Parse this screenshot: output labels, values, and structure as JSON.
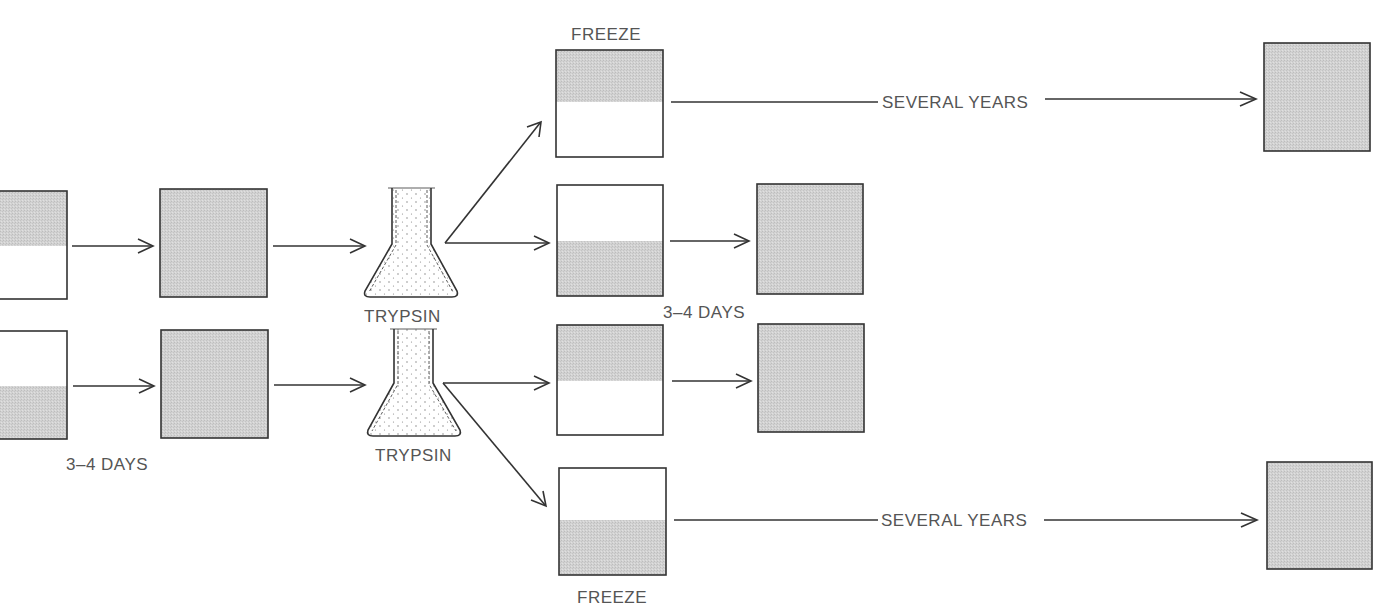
{
  "diagram": {
    "type": "cell-culture passage flow",
    "colors": {
      "line": "#333333",
      "fill": "#cfcfcf",
      "text": "#555555",
      "background": "#ffffff"
    },
    "labels": {
      "row1_interval": "3–4 DAYS",
      "row2_interval": "3–4 DAYS",
      "flask1": "TRYPSIN",
      "flask2": "TRYPSIN",
      "freeze_top": "FREEZE",
      "freeze_bottom": "FREEZE",
      "storage_top": "SEVERAL YEARS",
      "storage_bottom": "SEVERAL YEARS"
    },
    "nodes": [
      {
        "id": "start-top",
        "fill": "top-half"
      },
      {
        "id": "confluent-top",
        "fill": "full"
      },
      {
        "id": "start-bottom",
        "fill": "bottom-half"
      },
      {
        "id": "confluent-bottom",
        "fill": "full"
      },
      {
        "id": "trypsin-flask-top"
      },
      {
        "id": "trypsin-flask-bottom"
      },
      {
        "id": "freeze-top",
        "fill": "top-half"
      },
      {
        "id": "subculture-top",
        "fill": "bottom-half"
      },
      {
        "id": "subculture-top-grown",
        "fill": "full"
      },
      {
        "id": "subculture-bottom",
        "fill": "top-half"
      },
      {
        "id": "subculture-bottom-grown",
        "fill": "full"
      },
      {
        "id": "freeze-bottom",
        "fill": "bottom-half"
      },
      {
        "id": "thawed-top",
        "fill": "full"
      },
      {
        "id": "thawed-bottom",
        "fill": "full"
      }
    ]
  }
}
